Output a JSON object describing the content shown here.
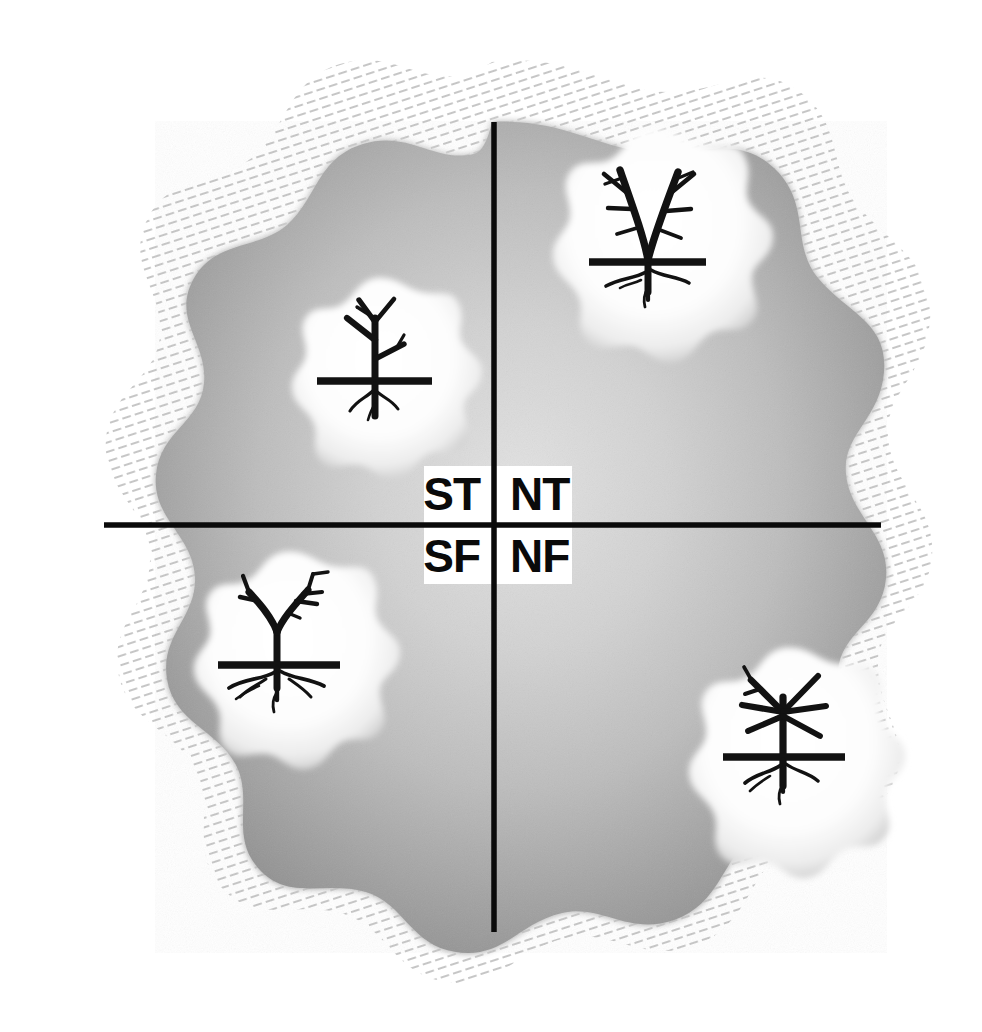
{
  "figure": {
    "background_color": "#ffffff",
    "disc": {
      "fill_light": "#d9d9d9",
      "fill_mid": "#b4b4b4",
      "fill_dark": "#8e8e8e",
      "center_x": 492,
      "center_y": 525,
      "radius_x": 390,
      "radius_y": 405
    },
    "halo": {
      "style": "hatched-stroke-aura",
      "color": "#cfcfcf",
      "description": "scalloped ring of short diagonal dashes surrounding the disc"
    },
    "axes": {
      "color": "#0a0a0a",
      "vertical": {
        "x": 494,
        "y_top": 122,
        "y_bottom": 932
      },
      "horizontal": {
        "y": 525,
        "x_left": 104,
        "x_right": 881
      }
    }
  },
  "quadrants": [
    {
      "id": "st",
      "label": "ST",
      "position": "top-left",
      "label_x": 470,
      "label_y": 505,
      "label_anchor": "end",
      "icon": {
        "name": "tree-icon-st",
        "blob_cx": 375,
        "blob_cy": 352,
        "blob_r": 74,
        "tree_style": "sparse-slender",
        "description": "slender tree with few thin branches, ground line and fine roots"
      }
    },
    {
      "id": "nt",
      "label": "NT",
      "position": "top-right",
      "label_x": 518,
      "label_y": 505,
      "label_anchor": "start",
      "icon": {
        "name": "tree-icon-nt",
        "blob_cx": 648,
        "blob_cy": 215,
        "blob_r": 86,
        "tree_style": "twin-trunk-branched",
        "description": "two trunks forming a V with many side branches, ground line and roots"
      }
    },
    {
      "id": "sf",
      "label": "SF",
      "position": "bottom-left",
      "label_x": 470,
      "label_y": 568,
      "label_anchor": "end",
      "icon": {
        "name": "tree-icon-sf",
        "blob_cx": 283,
        "blob_cy": 632,
        "blob_r": 80,
        "tree_style": "broad-canopy-deep-roots",
        "description": "Y-shaped canopy with sub-branches and a dense spreading root system"
      }
    },
    {
      "id": "nf",
      "label": "NF",
      "position": "bottom-right",
      "label_x": 518,
      "label_y": 568,
      "label_anchor": "start",
      "icon": {
        "name": "tree-icon-nf",
        "blob_cx": 783,
        "blob_cy": 730,
        "blob_r": 82,
        "tree_style": "radiating-starburst",
        "description": "straight branches radiating from one point like a starburst, ground line and roots"
      }
    }
  ],
  "center_label_box": {
    "fill": "#ffffff",
    "x": 424,
    "y": 466,
    "width": 148,
    "height": 118
  }
}
